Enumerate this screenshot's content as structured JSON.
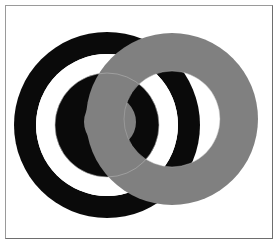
{
  "figure": {
    "canvas": {
      "width": 280,
      "height": 248,
      "background_color": "#ffffff"
    },
    "frame": {
      "name": "image-border",
      "stroke_color": "#8a8a8a",
      "stroke_width": 1,
      "x": 5,
      "y": 5,
      "width": 268,
      "height": 234
    },
    "colors": {
      "black": "#0a0a0a",
      "gray": "#808080",
      "white": "#ffffff",
      "outline": "#b4b4b4",
      "frame": "#8a8a8a"
    },
    "shapes": [
      {
        "name": "black-outer-ring",
        "type": "annulus",
        "cx": 107,
        "cy": 125,
        "outer_r": 93,
        "inner_r": 71,
        "fill": "#0a0a0a"
      },
      {
        "name": "white-gap-ring",
        "type": "annulus",
        "cx": 107,
        "cy": 125,
        "outer_r": 71,
        "inner_r": 52,
        "fill": "#ffffff"
      },
      {
        "name": "black-inner-disc",
        "type": "disc",
        "cx": 107,
        "cy": 125,
        "outer_r": 52,
        "inner_r": 0,
        "fill": "#0a0a0a"
      },
      {
        "name": "gray-center-disc",
        "type": "disc",
        "cx": 110,
        "cy": 122,
        "outer_r": 26,
        "inner_r": 0,
        "fill": "#808080"
      },
      {
        "name": "gray-overlay-annulus",
        "type": "annulus",
        "cx": 172,
        "cy": 119,
        "outer_r": 86,
        "inner_r": 48,
        "fill": "#808080"
      }
    ],
    "outlines": [
      {
        "name": "faint-circle-outline-left",
        "cx": 107,
        "cy": 125,
        "r": 52,
        "stroke": "#b4b4b4"
      },
      {
        "name": "faint-circle-outline-right",
        "cx": 172,
        "cy": 119,
        "r": 48,
        "stroke": "#b4b4b4"
      }
    ],
    "chart_data": {
      "type": "scatter",
      "title": "Overlapping concentric ring target with gray annulus",
      "xlabel": "",
      "ylabel": "",
      "categories": [
        "black-outer-ring",
        "white-gap-ring",
        "black-inner-disc",
        "gray-center-disc",
        "gray-overlay-annulus"
      ],
      "values": [
        93,
        71,
        52,
        26,
        86
      ],
      "legend": []
    }
  }
}
